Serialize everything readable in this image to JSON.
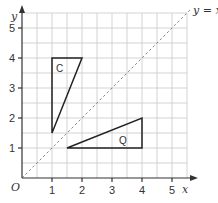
{
  "diagram": {
    "origin_label": "O",
    "x_axis": {
      "label": "x",
      "ticks": [
        "1",
        "2",
        "3",
        "4",
        "5"
      ]
    },
    "y_axis": {
      "label": "y",
      "ticks": [
        "1",
        "2",
        "3",
        "4",
        "5"
      ]
    },
    "mirror_line": {
      "label": "y = x",
      "equation": "y = x",
      "style": "dashed"
    },
    "shapes": [
      {
        "label": "C",
        "vertices": [
          [
            1,
            1.5
          ],
          [
            1,
            4
          ],
          [
            2,
            4
          ]
        ]
      },
      {
        "label": "Q",
        "vertices": [
          [
            1.5,
            1
          ],
          [
            4,
            1
          ],
          [
            4,
            2
          ]
        ]
      }
    ],
    "grid": {
      "range_x": [
        0,
        5.5
      ],
      "range_y": [
        0,
        5.5
      ],
      "minor_step": 0.5
    },
    "colors": {
      "grid": "#c8c8c8",
      "axis": "#333333",
      "shape": "#222222",
      "mirror": "#888888"
    }
  }
}
